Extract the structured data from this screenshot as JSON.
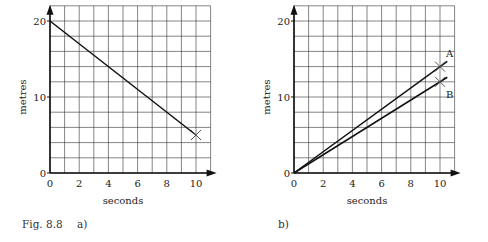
{
  "caption": {
    "figure": "Fig. 8.8",
    "label_a": "a)",
    "label_b": "b)"
  },
  "chart_data": [
    {
      "id": "a",
      "type": "line",
      "title": "",
      "xlabel": "seconds",
      "ylabel": "metres",
      "xlim": [
        0,
        11
      ],
      "ylim": [
        0,
        22
      ],
      "xticks": [
        0,
        2,
        4,
        6,
        8,
        10
      ],
      "yticks": [
        0,
        10,
        20
      ],
      "grid": true,
      "grid_x_step": 1,
      "grid_y_step": 2,
      "series": [
        {
          "name": "",
          "x": [
            0,
            10
          ],
          "y": [
            20,
            5
          ],
          "marker_at_end": "x"
        }
      ]
    },
    {
      "id": "b",
      "type": "line",
      "title": "",
      "xlabel": "seconds",
      "ylabel": "metres",
      "xlim": [
        0,
        11
      ],
      "ylim": [
        0,
        22
      ],
      "xticks": [
        0,
        2,
        4,
        6,
        8,
        10
      ],
      "yticks": [
        0,
        10,
        20
      ],
      "grid": true,
      "grid_x_step": 1,
      "grid_y_step": 2,
      "series": [
        {
          "name": "A",
          "x": [
            0,
            10
          ],
          "y": [
            0,
            14
          ],
          "extend_to_x": 10.5,
          "marker_at": [
            10,
            14
          ]
        },
        {
          "name": "B",
          "x": [
            0,
            10
          ],
          "y": [
            0,
            12
          ],
          "extend_to_x": 10.5,
          "marker_at": [
            10,
            12
          ]
        }
      ]
    }
  ]
}
